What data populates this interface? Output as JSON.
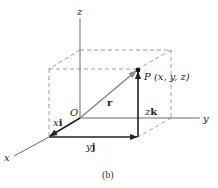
{
  "figure": {
    "caption": "(b)",
    "colors": {
      "ink": "#222222",
      "dashed": "#777777",
      "position_vector": "#888888",
      "background": "#ffffff"
    },
    "axes": {
      "x_label": "x",
      "y_label": "y",
      "z_label": "z"
    },
    "origin_label": "O",
    "point_label": "P (x, y, z)",
    "vectors": {
      "position": "r",
      "x_component_coef": "x",
      "x_component_unit": "i",
      "y_component_coef": "y",
      "y_component_unit": "j",
      "z_component_coef": "z",
      "z_component_unit": "k"
    }
  }
}
